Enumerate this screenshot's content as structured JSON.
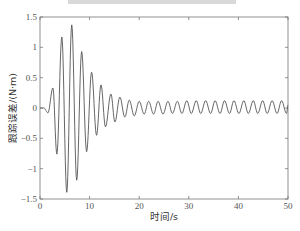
{
  "chart_data": {
    "type": "line",
    "title": "",
    "title_cropped": true,
    "xlabel": "时间/s",
    "ylabel": "跟踪误差/(N·m)",
    "xlim": [
      0,
      50
    ],
    "ylim": [
      -1.5,
      1.5
    ],
    "xticks": [
      0,
      10,
      20,
      30,
      40,
      50
    ],
    "xtick_labels": [
      "0",
      "10",
      "20",
      "30",
      "40",
      "50"
    ],
    "yticks": [
      -1.5,
      -1,
      -0.5,
      0,
      0.5,
      1,
      1.5
    ],
    "ytick_labels": [
      "-1.5",
      "-1",
      "-0.5",
      "0",
      "0.5",
      "1",
      "1.5"
    ],
    "grid": false,
    "legend": null,
    "line_color": "#555555",
    "series": [
      {
        "name": "跟踪误差",
        "x": [
          0,
          0.8,
          1.6,
          2.6,
          3.4,
          4.4,
          5.4,
          6.4,
          7.4,
          8.4,
          9.4,
          10.4,
          11.4,
          12.3,
          13.2,
          14.3,
          15.1,
          16.1,
          17.1,
          18.0,
          19.0,
          20.0,
          21.0,
          21.9,
          22.9,
          23.8,
          24.8,
          25.8,
          26.7,
          27.7,
          28.6,
          29.6,
          30.5,
          31.5,
          32.4,
          33.4,
          34.4,
          35.3,
          36.3,
          37.2,
          38.2,
          39.1,
          40.1,
          41.1,
          42.0,
          43.0,
          43.9,
          44.9,
          45.8,
          46.8,
          47.8,
          48.7,
          49.7,
          50.0
        ],
        "values": [
          0,
          0,
          -0.08,
          0.33,
          -0.76,
          1.17,
          -1.39,
          1.37,
          -1.19,
          0.93,
          -0.72,
          0.59,
          -0.45,
          0.38,
          -0.31,
          0.23,
          -0.23,
          0.18,
          -0.15,
          0.13,
          -0.13,
          0.11,
          -0.1,
          0.11,
          -0.1,
          0.11,
          -0.1,
          0.11,
          -0.09,
          0.11,
          -0.09,
          0.12,
          -0.09,
          0.12,
          -0.09,
          0.12,
          -0.09,
          0.12,
          -0.09,
          0.12,
          -0.09,
          0.12,
          -0.09,
          0.12,
          -0.09,
          0.12,
          -0.09,
          0.12,
          -0.09,
          0.12,
          -0.09,
          0.12,
          -0.09,
          0.05
        ]
      }
    ]
  }
}
